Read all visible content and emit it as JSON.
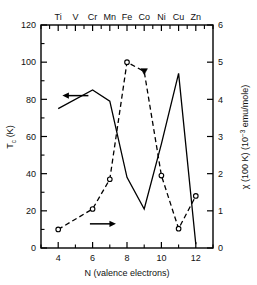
{
  "chart_data": {
    "type": "line",
    "title": "",
    "xlabel": "N (valence electrons)",
    "ylabel": "T_c (K)",
    "y2label": "χ (100 K) (10^-3 emu/mole)",
    "xlim": [
      3,
      13
    ],
    "ylim": [
      0,
      120
    ],
    "y2lim": [
      0,
      6
    ],
    "xticks": [
      4,
      6,
      8,
      10,
      12
    ],
    "xticklabels": [
      "4",
      "6",
      "8",
      "10",
      "12"
    ],
    "xminorticks": [
      3,
      5,
      7,
      9,
      11,
      13
    ],
    "yticks": [
      0,
      20,
      40,
      60,
      80,
      100,
      120
    ],
    "yticklabels": [
      "0",
      "20",
      "40",
      "60",
      "80",
      "100",
      "120"
    ],
    "yminorticks": [
      10,
      30,
      50,
      70,
      90,
      110
    ],
    "y2ticks": [
      0,
      1,
      2,
      3,
      4,
      5,
      6
    ],
    "y2ticklabels": [
      "0",
      "1",
      "2",
      "3",
      "4",
      "5",
      "6"
    ],
    "grid": false,
    "legend": "none",
    "top_axis": {
      "label": "",
      "ticks": [
        4,
        5,
        6,
        7,
        8,
        9,
        10,
        11,
        12
      ],
      "ticklabels": [
        "Ti",
        "V",
        "Cr",
        "Mn",
        "Fe",
        "Co",
        "Ni",
        "Cu",
        "Zn"
      ],
      "minorticks": [
        3,
        3.5,
        4.5,
        5.5,
        6.5,
        7.5,
        8.5,
        9.5,
        10.5,
        11.5,
        12.5,
        13
      ]
    },
    "series": [
      {
        "name": "T_c (K)",
        "axis": "left",
        "style": "solid",
        "marker": "none",
        "x": [
          4,
          6,
          7,
          8,
          9,
          10,
          11,
          12
        ],
        "values": [
          75,
          85,
          79,
          38,
          21,
          56,
          94,
          2
        ]
      },
      {
        "name": "χ (100 K) (10^-3 emu/mole)",
        "axis": "right",
        "style": "dashed",
        "marker": "open-circle",
        "x": [
          4,
          6,
          7,
          8,
          9,
          10,
          11,
          12
        ],
        "values": [
          0.5,
          1.05,
          1.85,
          5.0,
          4.75,
          1.95,
          0.52,
          1.4
        ],
        "marker_overrides": {
          "9": "filled-triangle"
        }
      }
    ],
    "annotations": [
      {
        "name": "left-arrow",
        "text": "",
        "x": 5.0,
        "y": 82,
        "axis": "left",
        "direction": "left"
      },
      {
        "name": "right-arrow",
        "text": "",
        "x": 6.6,
        "y": 0.65,
        "axis": "right",
        "direction": "right"
      }
    ]
  },
  "axes": {
    "left_label_main": "T",
    "left_label_sub": "c",
    "left_label_unit": " (K)",
    "right_label_chi": "χ (100 K) (10",
    "right_label_sup": "−3",
    "right_label_tail": " emu/mole)",
    "bottom_label": "N (valence electrons)"
  }
}
